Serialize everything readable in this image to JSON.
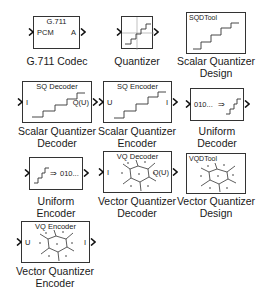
{
  "library": {
    "blocks": [
      {
        "id": "g711",
        "title": "G.711",
        "in_port": "PCM",
        "out_port": "A",
        "label": "G.711 Codec"
      },
      {
        "id": "quantizer",
        "label": "Quantizer"
      },
      {
        "id": "sqdtool",
        "tool_title": "SQDTool",
        "label_line1": "Scalar Quantizer",
        "label_line2": "Design"
      },
      {
        "id": "sq-decoder",
        "title": "SQ Decoder",
        "in_port": "I",
        "out_port": "Q(U)",
        "label_line1": "Scalar Quantizer",
        "label_line2": "Decoder"
      },
      {
        "id": "sq-encoder",
        "title": "SQ Encoder",
        "in_port": "U",
        "out_port": "I",
        "label_line1": "Scalar Quantizer",
        "label_line2": "Encoder"
      },
      {
        "id": "uniform-decoder",
        "inner_text": "010...",
        "arrow": "⇒",
        "label_line1": "Uniform",
        "label_line2": "Decoder"
      },
      {
        "id": "uniform-encoder",
        "inner_text": "010...",
        "arrow": "⇒",
        "label_line1": "Uniform",
        "label_line2": "Encoder"
      },
      {
        "id": "vq-decoder",
        "title": "VQ Decoder",
        "in_port": "I",
        "out_port": "Q(U)",
        "label_line1": "Vector Quantizer",
        "label_line2": "Decoder"
      },
      {
        "id": "vqdtool",
        "tool_title": "VQDTool",
        "label_line1": "Vector Quantizer",
        "label_line2": "Design"
      },
      {
        "id": "vq-encoder",
        "title": "VQ Encoder",
        "in_port": "U",
        "out_port": "I",
        "label_line1": "Vector Quantizer",
        "label_line2": "Encoder"
      }
    ]
  },
  "colors": {
    "stroke": "#333333",
    "background": "#ffffff",
    "text": "#1a1a1a"
  }
}
